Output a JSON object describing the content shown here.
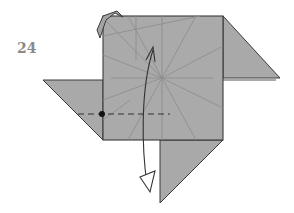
{
  "diagram": {
    "type": "origami-step",
    "step_number": "24",
    "colors": {
      "paper": "#a9a9a9",
      "edge": "#3a3a3a",
      "crease": "#8c8c8c",
      "background": "#ffffff",
      "dot": "#111111",
      "arrow": "#333333",
      "step_text": "#8a8a8a"
    },
    "symbols": [
      {
        "name": "valley-fold-line",
        "style": "dashed",
        "orientation": "horizontal"
      },
      {
        "name": "reference-dot",
        "style": "filled-circle"
      },
      {
        "name": "fold-arrow",
        "style": "curved, hollow triangular head, pointing down"
      }
    ]
  }
}
